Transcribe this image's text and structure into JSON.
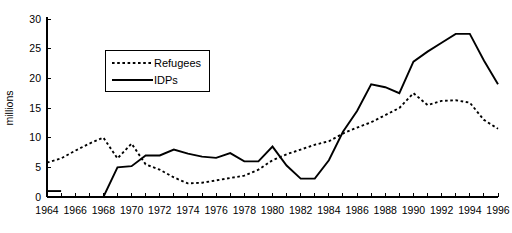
{
  "chart_data": {
    "type": "line",
    "title": "",
    "xlabel": "",
    "ylabel": "millions",
    "xlim": [
      1964,
      1996
    ],
    "ylim": [
      0,
      30
    ],
    "ytick_values": [
      0,
      5,
      10,
      15,
      20,
      25,
      30
    ],
    "ytick_labels": [
      "0",
      "5",
      "10",
      "15",
      "20",
      "25",
      "30"
    ],
    "xtick_values": [
      1964,
      1966,
      1968,
      1970,
      1972,
      1974,
      1976,
      1978,
      1980,
      1982,
      1984,
      1986,
      1988,
      1990,
      1992,
      1994,
      1996
    ],
    "xtick_labels": [
      "1964",
      "1966",
      "1968",
      "1970",
      "1972",
      "1974",
      "1976",
      "1978",
      "1980",
      "1982",
      "1984",
      "1986",
      "1988",
      "1990",
      "1992",
      "1994",
      "1996"
    ],
    "x_minor_tick_interval": 1,
    "grid": false,
    "legend_position": "upper-left-inside",
    "x": [
      1964,
      1965,
      1966,
      1967,
      1968,
      1969,
      1970,
      1971,
      1972,
      1973,
      1974,
      1975,
      1976,
      1977,
      1978,
      1979,
      1980,
      1981,
      1982,
      1983,
      1984,
      1985,
      1986,
      1987,
      1988,
      1989,
      1990,
      1991,
      1992,
      1993,
      1994,
      1995,
      1996
    ],
    "series": [
      {
        "name": "Refugees",
        "style": "dotted",
        "color": "#000000",
        "values": [
          5.8,
          6.5,
          7.8,
          9.0,
          10.0,
          6.5,
          9.0,
          5.5,
          4.6,
          3.3,
          2.3,
          2.4,
          2.8,
          3.2,
          3.6,
          4.6,
          6.2,
          7.2,
          8.0,
          8.8,
          9.4,
          10.7,
          11.7,
          12.6,
          13.8,
          15.0,
          17.5,
          15.5,
          16.2,
          16.3,
          15.9,
          13.0,
          11.5
        ]
      },
      {
        "name": "IDPs",
        "style": "solid",
        "color": "#000000",
        "values": [
          1.0,
          1.0,
          null,
          0.0,
          0.0,
          5.0,
          5.2,
          7.0,
          7.0,
          8.0,
          7.3,
          6.8,
          6.6,
          7.4,
          6.0,
          6.0,
          8.5,
          5.3,
          3.1,
          3.1,
          6.2,
          11.0,
          14.5,
          19.0,
          18.5,
          17.5,
          22.8,
          24.5,
          26.0,
          27.5,
          27.5,
          23.0,
          19.0
        ]
      }
    ],
    "series_gap_note": "IDPs series has a short isolated segment spanning 1964-1965 at 1.0, then data resumes at 1967"
  },
  "legend": {
    "entries": [
      {
        "label": "Refugees",
        "style": "dotted"
      },
      {
        "label": "IDPs",
        "style": "solid"
      }
    ]
  },
  "axes": {
    "y_axis_title": "millions"
  }
}
